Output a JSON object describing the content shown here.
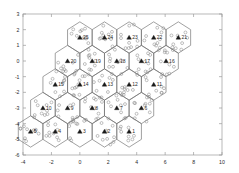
{
  "figure": {
    "type": "matlab-figure",
    "background": "#ffffff",
    "axes_color": "#9a9a9a",
    "cell_edge_color": "#6e6e6e",
    "bs_marker_color": "#1a1a1a",
    "ue_marker_color": "#8c8c8c",
    "label_color": "#2b2b2b"
  },
  "chart_data": {
    "type": "scatter",
    "title": "",
    "xlabel": "",
    "ylabel": "",
    "xlim": [
      -4,
      10
    ],
    "ylim": [
      -6,
      3
    ],
    "xticks": [
      -4,
      -2,
      0,
      2,
      4,
      6,
      8,
      10
    ],
    "yticks": [
      3,
      2,
      1,
      0,
      -1,
      -2,
      -3,
      -4,
      -5,
      -6
    ],
    "xticklabels": [
      "-4",
      "-2",
      "0",
      "2",
      "4",
      "6",
      "8",
      "10"
    ],
    "yticklabels": [
      "3",
      "2",
      "1",
      "0",
      "-1",
      "-2",
      "-3",
      "-4",
      "-5",
      "-6"
    ],
    "grid": false,
    "legend": null,
    "hex_radius": 1.0,
    "series": [
      {
        "name": "base-stations",
        "marker": "triangle",
        "color": "#1a1a1a",
        "points": [
          {
            "id": 25,
            "x": 0.0,
            "y": 1.5
          },
          {
            "id": 24,
            "x": 1.732,
            "y": 1.5
          },
          {
            "id": 23,
            "x": 3.464,
            "y": 1.5
          },
          {
            "id": 22,
            "x": 5.196,
            "y": 1.5
          },
          {
            "id": 21,
            "x": 6.928,
            "y": 1.5
          },
          {
            "id": 20,
            "x": -0.866,
            "y": 0.0
          },
          {
            "id": 19,
            "x": 0.866,
            "y": 0.0
          },
          {
            "id": 18,
            "x": 2.598,
            "y": 0.0
          },
          {
            "id": 17,
            "x": 4.33,
            "y": 0.0
          },
          {
            "id": 16,
            "x": 6.062,
            "y": 0.0
          },
          {
            "id": 15,
            "x": -1.732,
            "y": -1.5
          },
          {
            "id": 14,
            "x": 0.0,
            "y": -1.5
          },
          {
            "id": 13,
            "x": 1.732,
            "y": -1.5
          },
          {
            "id": 12,
            "x": 3.464,
            "y": -1.5
          },
          {
            "id": 11,
            "x": 5.196,
            "y": -1.5
          },
          {
            "id": 10,
            "x": -2.598,
            "y": -3.0
          },
          {
            "id": 9,
            "x": -0.866,
            "y": -3.0
          },
          {
            "id": 8,
            "x": 0.866,
            "y": -3.0
          },
          {
            "id": 7,
            "x": 2.598,
            "y": -3.0
          },
          {
            "id": 6,
            "x": 4.33,
            "y": -3.0
          },
          {
            "id": 5,
            "x": -3.464,
            "y": -4.5
          },
          {
            "id": 4,
            "x": -1.732,
            "y": -4.5
          },
          {
            "id": 3,
            "x": 0.0,
            "y": -4.5
          },
          {
            "id": 2,
            "x": 1.732,
            "y": -4.5
          },
          {
            "id": 1,
            "x": 3.464,
            "y": -4.5
          }
        ]
      },
      {
        "name": "user-equipment",
        "marker": "circle",
        "color": "#8c8c8c",
        "per_cell_count": 10
      }
    ],
    "cell_labels": [
      "1",
      "2",
      "3",
      "4",
      "5",
      "6",
      "7",
      "8",
      "9",
      "10",
      "11",
      "12",
      "13",
      "14",
      "15",
      "16",
      "17",
      "18",
      "19",
      "20",
      "21",
      "22",
      "23",
      "24",
      "25"
    ]
  }
}
